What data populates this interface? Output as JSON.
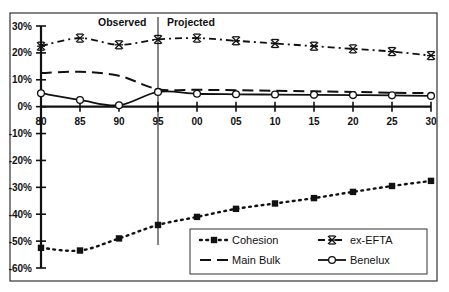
{
  "chart_data": {
    "type": "line",
    "title": "",
    "xlabel": "",
    "ylabel": "",
    "x": [
      "80",
      "85",
      "90",
      "95",
      "00",
      "05",
      "10",
      "15",
      "20",
      "25",
      "30"
    ],
    "ylim": [
      -60,
      30
    ],
    "yticks": [
      "30%",
      "20%",
      "10%",
      "0%",
      "-10%",
      "-20%",
      "-30%",
      "-40%",
      "-50%",
      "-60%"
    ],
    "ytick_values": [
      30,
      20,
      10,
      0,
      -10,
      -20,
      -30,
      -40,
      -50,
      -60
    ],
    "grid": false,
    "annotations": [
      {
        "text": "Observed",
        "position": "left of divider"
      },
      {
        "text": "Projected",
        "position": "right of divider"
      }
    ],
    "divider_at": "95",
    "legend_position": "lower right, inside plot",
    "series": [
      {
        "name": "Cohesion",
        "style": "dotted-square",
        "values": [
          -52.5,
          -53.5,
          -49,
          -44,
          -41,
          -38,
          -36,
          -34,
          -31.7,
          -29.5,
          -27.6
        ]
      },
      {
        "name": "ex-EFTA",
        "style": "dash-dot-asterisk",
        "values": [
          22.5,
          25.5,
          23,
          25,
          25.5,
          24.5,
          23.5,
          22.5,
          21.5,
          20.5,
          19
        ]
      },
      {
        "name": "Main Bulk",
        "style": "dashed",
        "values": [
          12.5,
          13,
          11.5,
          6.5,
          6.3,
          6.1,
          5.9,
          5.7,
          5.5,
          5.2,
          5
        ]
      },
      {
        "name": "Benelux",
        "style": "solid-diamond",
        "values": [
          5,
          2.5,
          0.5,
          5.5,
          4.8,
          4.6,
          4.5,
          4.4,
          4.3,
          4.2,
          4
        ]
      }
    ]
  },
  "annotations": {
    "observed": "Observed",
    "projected": "Projected"
  },
  "legend": {
    "items": [
      {
        "label": "Cohesion"
      },
      {
        "label": "ex-EFTA"
      },
      {
        "label": "Main Bulk"
      },
      {
        "label": "Benelux"
      }
    ]
  },
  "colors": {
    "line": "#111111",
    "frame": "#333333",
    "background": "#ffffff"
  }
}
